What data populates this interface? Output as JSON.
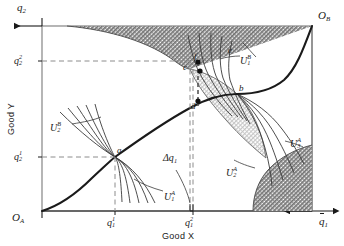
{
  "figure": {
    "type": "edgeworth-box-diagram",
    "axes": {
      "x_title": "Good X",
      "y_title": "Good Y",
      "origin_a": "O",
      "origin_a_sub": "A",
      "origin_b": "O",
      "origin_b_sub": "B",
      "x_endpoint": "q",
      "x_endpoint_sub": "1",
      "y_endpoint": "q",
      "y_endpoint_sub": "2"
    },
    "ticks": {
      "x": [
        {
          "base": "q",
          "sub": "1",
          "sup": "1",
          "x": 115
        },
        {
          "base": "q",
          "sub": "1",
          "sup": "2",
          "x": 193
        }
      ],
      "y": [
        {
          "base": "q",
          "sub": "2",
          "sup": "2",
          "y": 61
        },
        {
          "base": "q",
          "sub": "2",
          "sup": "1",
          "y": 157
        }
      ]
    },
    "points": [
      {
        "id": "a",
        "label": "a",
        "x": 115,
        "y": 157,
        "dot": false
      },
      {
        "id": "b",
        "label": "b",
        "x": 237,
        "y": 94,
        "dot": false
      },
      {
        "id": "c",
        "label": "c",
        "x": 190,
        "y": 69,
        "dot": false
      },
      {
        "id": "d",
        "label": "d",
        "x": 198,
        "y": 106,
        "dot": true
      },
      {
        "id": "e",
        "label": "e",
        "x": 229,
        "y": 52,
        "dot": false
      },
      {
        "id": "f",
        "label": "f",
        "x": 198,
        "y": 62,
        "dot": true
      }
    ],
    "curve_labels": [
      {
        "base": "U",
        "sub": "1",
        "sup": "A",
        "x": 166,
        "y": 196
      },
      {
        "base": "U",
        "sub": "2",
        "sup": "A",
        "x": 228,
        "y": 172
      },
      {
        "base": "U",
        "sub": "3",
        "sup": "A",
        "x": 292,
        "y": 143
      },
      {
        "base": "U",
        "sub": "1",
        "sup": "B",
        "x": 242,
        "y": 60
      },
      {
        "base": "U",
        "sub": "2",
        "sup": "B",
        "x": 52,
        "y": 127
      }
    ],
    "annotations": [
      {
        "base": "Δq",
        "sub": "1",
        "sup": "",
        "x": 168,
        "y": 158
      }
    ],
    "colors": {
      "ink": "#1a1a1a",
      "box_line": "#6f6f6f",
      "dash": "#8c8c8c",
      "dark_hatch": "#8a8a8a",
      "light_hatch": "#d9d9d9",
      "curve": "#3a3a3a"
    }
  }
}
